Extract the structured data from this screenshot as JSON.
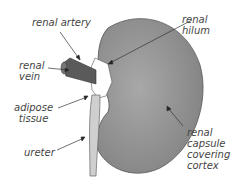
{
  "diagram": {
    "labels": {
      "renal_artery": "renal artery",
      "renal_hilum_1": "renal",
      "renal_hilum_2": "hilum",
      "renal_vein_1": "renal",
      "renal_vein_2": "vein",
      "adipose_1": "adipose",
      "adipose_2": "tissue",
      "ureter": "ureter",
      "capsule_1": "renal",
      "capsule_2": "capsule",
      "capsule_3": "covering",
      "capsule_4": "cortex"
    },
    "colors": {
      "kidney": "#8a8a8a",
      "vessel": "#5a5a5a",
      "ureter": "#c8c8c8",
      "text": "#444444"
    }
  }
}
